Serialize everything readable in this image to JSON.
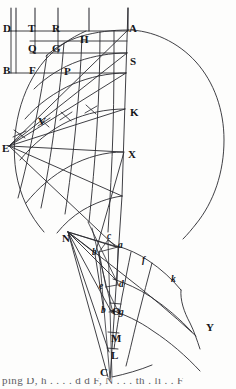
{
  "figure": {
    "kind": "engraved line figure",
    "width": 236,
    "height": 389,
    "ink_color": "#16161a",
    "line_color": "#2a2a30",
    "paper_color": "#fdfdfc"
  },
  "labels": {
    "uppercase": [
      {
        "text": "D",
        "x": 3,
        "y": 28
      },
      {
        "text": "T",
        "x": 28,
        "y": 28
      },
      {
        "text": "R",
        "x": 52,
        "y": 28
      },
      {
        "text": "A",
        "x": 125,
        "y": 28
      },
      {
        "text": "H",
        "x": 80,
        "y": 39
      },
      {
        "text": "Q",
        "x": 28,
        "y": 50
      },
      {
        "text": "G",
        "x": 52,
        "y": 50
      },
      {
        "text": "B",
        "x": 3,
        "y": 70
      },
      {
        "text": "F",
        "x": 28,
        "y": 70
      },
      {
        "text": "P",
        "x": 63,
        "y": 72
      },
      {
        "text": "S",
        "x": 125,
        "y": 61
      },
      {
        "text": "K",
        "x": 125,
        "y": 113
      },
      {
        "text": "V",
        "x": 38,
        "y": 122
      },
      {
        "text": "E",
        "x": 3,
        "y": 148
      },
      {
        "text": "X",
        "x": 125,
        "y": 155
      },
      {
        "text": "N",
        "x": 63,
        "y": 238
      },
      {
        "text": "O",
        "x": 111,
        "y": 312
      },
      {
        "text": "M",
        "x": 111,
        "y": 339
      },
      {
        "text": "L",
        "x": 111,
        "y": 356
      },
      {
        "text": "C",
        "x": 101,
        "y": 372
      },
      {
        "text": "Y",
        "x": 207,
        "y": 328
      }
    ],
    "lowercase": [
      {
        "text": "a",
        "x": 116,
        "y": 245
      },
      {
        "text": "c",
        "x": 107,
        "y": 237
      },
      {
        "text": "b",
        "x": 94,
        "y": 253
      },
      {
        "text": "f",
        "x": 141,
        "y": 262
      },
      {
        "text": "k",
        "x": 170,
        "y": 281
      },
      {
        "text": "e",
        "x": 101,
        "y": 287
      },
      {
        "text": "d",
        "x": 119,
        "y": 285
      },
      {
        "text": "b",
        "x": 103,
        "y": 311
      },
      {
        "text": "g",
        "x": 119,
        "y": 313
      }
    ]
  },
  "caption": {
    "text": "ping D, h . . . . d d F, N . . . th . li . . F",
    "note": "partially cropped running text at page foot"
  },
  "geometry": {
    "vertical_rules": [
      11,
      16,
      35,
      58,
      89,
      128
    ],
    "vertical_rules_top": 8,
    "vertical_rules_bottom": 31,
    "axis_line": {
      "x_top": 128,
      "y_top": 8,
      "x_bottom": 110,
      "y_bottom": 380
    },
    "horizontal_rules": [
      {
        "y": 31,
        "x1": 9,
        "x2": 130
      },
      {
        "y": 41,
        "x1": 30,
        "x2": 130
      },
      {
        "y": 53,
        "x1": 30,
        "x2": 130
      },
      {
        "y": 73,
        "x1": 9,
        "x2": 130
      }
    ],
    "major_arcs": [
      {
        "name": "outer-arc-A",
        "from": "A",
        "desc": "great circle through A sweeping right and down"
      },
      {
        "name": "inner-arc-E",
        "from": "E",
        "desc": "arc from upper-left through F to E and down"
      }
    ],
    "fan_center": {
      "x": 7,
      "y": 148,
      "label": "E"
    },
    "fan_rays": 7,
    "concentric_bands": 6,
    "tick_crosses": 4
  }
}
